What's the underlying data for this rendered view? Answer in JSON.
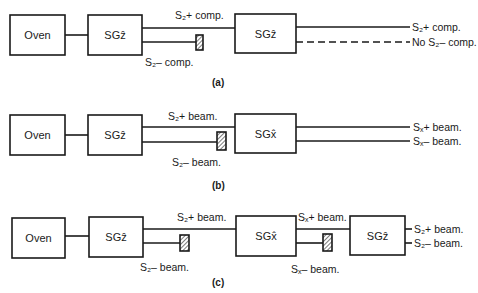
{
  "diagram": {
    "panels": [
      {
        "caption": "(a)",
        "boxes": [
          "Oven",
          "SGẑ",
          "SGẑ"
        ],
        "labels": {
          "mid_top": "S₂+ comp.",
          "mid_bottom": "S₂– comp.",
          "out_top": "S₂+ comp.",
          "out_bottom": "No S₂– comp."
        }
      },
      {
        "caption": "(b)",
        "boxes": [
          "Oven",
          "SGẑ",
          "SGx̂"
        ],
        "labels": {
          "mid_top": "S₂+ beam.",
          "mid_bottom": "S₂– beam.",
          "out_top": "Sₓ+ beam.",
          "out_bottom": "Sₓ– beam."
        }
      },
      {
        "caption": "(c)",
        "boxes": [
          "Oven",
          "SGẑ",
          "SGx̂",
          "SGẑ"
        ],
        "labels": {
          "mid1_top": "S₂+ beam.",
          "mid1_bottom": "S₂– beam.",
          "mid2_top": "Sₓ+ beam.",
          "mid2_bottom": "Sₓ– beam.",
          "out_top": "S₂+ beam.",
          "out_bottom": "S₂– beam."
        }
      }
    ]
  }
}
